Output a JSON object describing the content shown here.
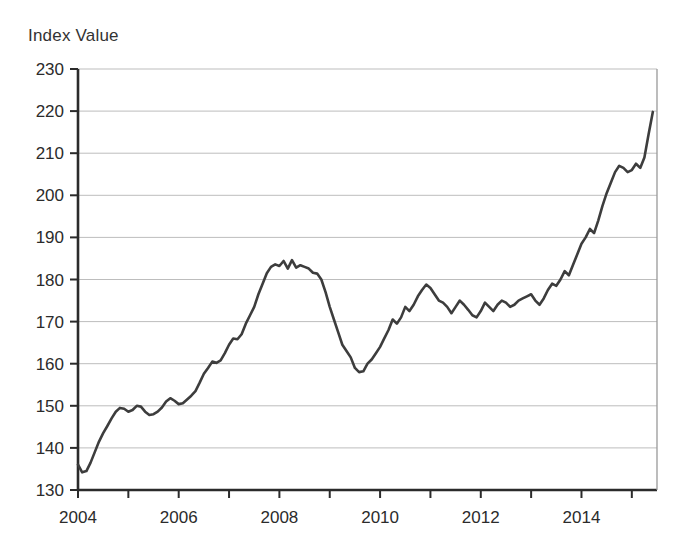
{
  "chart_data": {
    "type": "line",
    "title": "",
    "ylabel": "Index Value",
    "xlabel": "",
    "ylim": [
      130,
      230
    ],
    "xlim": [
      2004.0,
      2015.5
    ],
    "y_ticks": [
      130,
      140,
      150,
      160,
      170,
      180,
      190,
      200,
      210,
      220,
      230
    ],
    "x_ticks": [
      2004,
      2005,
      2006,
      2007,
      2008,
      2009,
      2010,
      2011,
      2012,
      2013,
      2014,
      2015
    ],
    "x_tick_labels": [
      "2004",
      "",
      "2006",
      "",
      "2008",
      "",
      "2010",
      "",
      "2012",
      "",
      "2014",
      ""
    ],
    "grid": "horizontal",
    "legend": "none",
    "line_color": "#3d3d3d",
    "line_width": 2.6,
    "series": [
      {
        "name": "Index Value",
        "x": [
          2004.0,
          2004.083,
          2004.167,
          2004.25,
          2004.333,
          2004.417,
          2004.5,
          2004.583,
          2004.667,
          2004.75,
          2004.833,
          2004.917,
          2005.0,
          2005.083,
          2005.167,
          2005.25,
          2005.333,
          2005.417,
          2005.5,
          2005.583,
          2005.667,
          2005.75,
          2005.833,
          2005.917,
          2006.0,
          2006.083,
          2006.167,
          2006.25,
          2006.333,
          2006.417,
          2006.5,
          2006.583,
          2006.667,
          2006.75,
          2006.833,
          2006.917,
          2007.0,
          2007.083,
          2007.167,
          2007.25,
          2007.333,
          2007.417,
          2007.5,
          2007.583,
          2007.667,
          2007.75,
          2007.833,
          2007.917,
          2008.0,
          2008.083,
          2008.167,
          2008.25,
          2008.333,
          2008.417,
          2008.5,
          2008.583,
          2008.667,
          2008.75,
          2008.833,
          2008.917,
          2009.0,
          2009.083,
          2009.167,
          2009.25,
          2009.333,
          2009.417,
          2009.5,
          2009.583,
          2009.667,
          2009.75,
          2009.833,
          2009.917,
          2010.0,
          2010.083,
          2010.167,
          2010.25,
          2010.333,
          2010.417,
          2010.5,
          2010.583,
          2010.667,
          2010.75,
          2010.833,
          2010.917,
          2011.0,
          2011.083,
          2011.167,
          2011.25,
          2011.333,
          2011.417,
          2011.5,
          2011.583,
          2011.667,
          2011.75,
          2011.833,
          2011.917,
          2012.0,
          2012.083,
          2012.167,
          2012.25,
          2012.333,
          2012.417,
          2012.5,
          2012.583,
          2012.667,
          2012.75,
          2012.833,
          2012.917,
          2013.0,
          2013.083,
          2013.167,
          2013.25,
          2013.333,
          2013.417,
          2013.5,
          2013.583,
          2013.667,
          2013.75,
          2013.833,
          2013.917,
          2014.0,
          2014.083,
          2014.167,
          2014.25,
          2014.333,
          2014.417,
          2014.5,
          2014.583,
          2014.667,
          2014.75,
          2014.833,
          2014.917,
          2015.0,
          2015.083,
          2015.167,
          2015.25,
          2015.333,
          2015.417
        ],
        "values": [
          136.0,
          134.2,
          134.5,
          136.5,
          139.0,
          141.5,
          143.5,
          145.2,
          147.0,
          148.6,
          149.5,
          149.3,
          148.6,
          149.0,
          150.0,
          149.8,
          148.6,
          147.8,
          148.0,
          148.6,
          149.6,
          151.0,
          151.8,
          151.2,
          150.4,
          150.6,
          151.5,
          152.4,
          153.5,
          155.5,
          157.6,
          159.0,
          160.5,
          160.2,
          160.8,
          162.5,
          164.5,
          166.0,
          165.8,
          167.0,
          169.5,
          171.5,
          173.5,
          176.5,
          179.0,
          181.5,
          183.0,
          183.6,
          183.2,
          184.4,
          182.6,
          184.6,
          182.8,
          183.4,
          183.0,
          182.6,
          181.6,
          181.4,
          180.0,
          177.0,
          173.5,
          170.5,
          167.5,
          164.5,
          163.0,
          161.5,
          159.0,
          158.0,
          158.2,
          160.0,
          161.0,
          162.5,
          164.0,
          166.0,
          168.0,
          170.5,
          169.5,
          171.0,
          173.5,
          172.5,
          174.0,
          176.0,
          177.5,
          178.8,
          178.0,
          176.5,
          175.0,
          174.5,
          173.5,
          172.0,
          173.5,
          175.0,
          174.0,
          172.8,
          171.5,
          171.0,
          172.5,
          174.5,
          173.5,
          172.5,
          174.0,
          175.0,
          174.5,
          173.5,
          174.0,
          175.0,
          175.5,
          176.0,
          176.5,
          175.0,
          174.0,
          175.5,
          177.5,
          179.0,
          178.5,
          180.0,
          182.0,
          181.0,
          183.5,
          186.0,
          188.5,
          190.0,
          192.0,
          191.0,
          194.0,
          197.5,
          200.5,
          203.0,
          205.5,
          207.0,
          206.5,
          205.5,
          206.0,
          207.5,
          206.5,
          209.0,
          214.5,
          219.8
        ]
      }
    ]
  }
}
